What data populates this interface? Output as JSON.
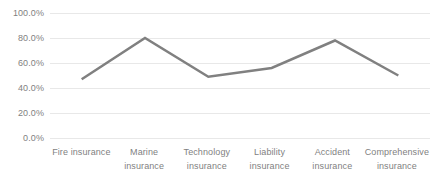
{
  "chart_data": {
    "type": "line",
    "title": "",
    "subtitle": "",
    "xlabel": "",
    "ylabel": "",
    "categories": [
      "Fire insurance",
      "Marine insurance",
      "Technology insurance",
      "Liability insurance",
      "Accident insurance",
      "Comprehensive insurance"
    ],
    "category_lines": [
      [
        "Fire insurance"
      ],
      [
        "Marine",
        "insurance"
      ],
      [
        "Technology",
        "insurance"
      ],
      [
        "Liability",
        "insurance"
      ],
      [
        "Accident",
        "insurance"
      ],
      [
        "Comprehensive",
        "insurance"
      ]
    ],
    "values": [
      47,
      80,
      49,
      56,
      78,
      50
    ],
    "value_labels": [
      "47.0%",
      "80.0%",
      "49.0%",
      "56.0%",
      "78.0%",
      "50.0%"
    ],
    "ylim": [
      0,
      100
    ],
    "ytick_values": [
      0,
      20,
      40,
      60,
      80,
      100
    ],
    "ytick_labels": [
      "0.0%",
      "20.0%",
      "40.0%",
      "60.0%",
      "80.0%",
      "100.0%"
    ],
    "grid": true,
    "grid_axis": "y",
    "legend": false,
    "legend_position": "none",
    "series": [
      {
        "name": "Series 1",
        "values": [
          47,
          80,
          49,
          56,
          78,
          50
        ],
        "color": "#808080",
        "line_width": 2.5,
        "markers": false
      }
    ],
    "colors": {
      "line": "#808080",
      "gridline": "#e8e8e8",
      "tick_label": "#7f7f7f",
      "background": "#ffffff"
    }
  }
}
